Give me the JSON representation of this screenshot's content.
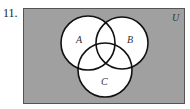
{
  "problem": {
    "number": "11."
  },
  "diagram": {
    "type": "venn",
    "universe_label": "U",
    "sets": [
      {
        "label": "A",
        "cx": 88,
        "cy": 43,
        "r": 27
      },
      {
        "label": "B",
        "cx": 122,
        "cy": 43,
        "r": 26
      },
      {
        "label": "C",
        "cx": 105,
        "cy": 70,
        "r": 27
      }
    ],
    "colors": {
      "universe_fill": "#a0a0a0",
      "set_fill": "#ffffff",
      "stroke": "#111111"
    }
  }
}
